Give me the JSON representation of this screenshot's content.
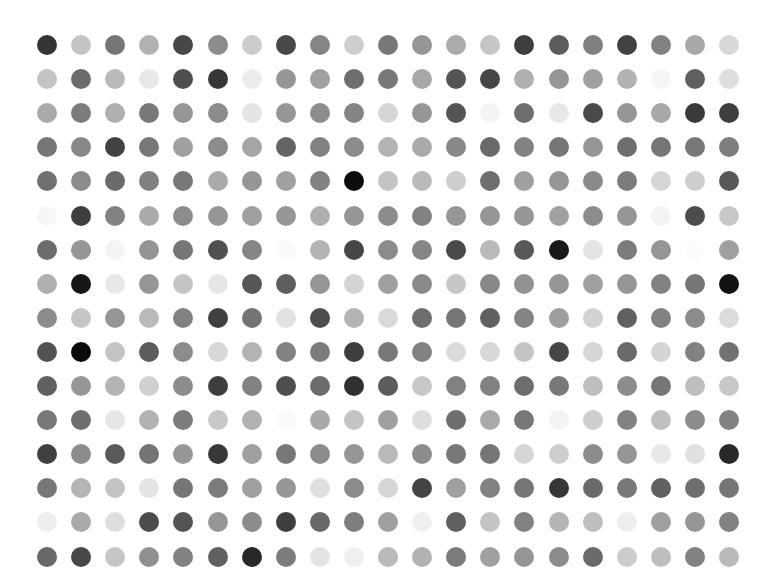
{
  "page": {
    "background_color": "#ffffff",
    "width": 772,
    "height": 586
  },
  "chart_data": {
    "type": "heatmap",
    "title": "",
    "subtitle": "",
    "xlabel": "",
    "ylabel": "",
    "legend": [],
    "annotations": [],
    "grid": false,
    "marker": "circle",
    "columns": 21,
    "rows": 16,
    "xlim": [
      0,
      20
    ],
    "ylim": [
      0,
      15
    ],
    "x_tick_labels": [],
    "y_tick_labels": [],
    "layout": {
      "origin_x": 47,
      "origin_y": 45,
      "pitch_x": 34.1,
      "pitch_y": 34.1,
      "dot_diameter": 20
    },
    "colormap": "grayscale",
    "value_range": [
      0,
      255
    ],
    "values": [
      [
        52,
        196,
        118,
        178,
        70,
        140,
        204,
        72,
        133,
        206,
        120,
        150,
        171,
        198,
        62,
        92,
        128,
        66,
        130,
        168,
        216,
        240,
        96
      ],
      [
        196,
        108,
        186,
        232,
        78,
        54,
        236,
        150,
        160,
        110,
        120,
        168,
        84,
        70,
        176,
        150,
        160,
        178,
        246,
        96,
        222,
        44,
        52
      ],
      [
        170,
        124,
        176,
        120,
        150,
        140,
        228,
        150,
        140,
        132,
        214,
        150,
        84,
        244,
        110,
        232,
        74,
        150,
        168,
        58,
        62,
        140,
        96
      ],
      [
        118,
        136,
        66,
        120,
        160,
        140,
        166,
        100,
        130,
        140,
        180,
        170,
        136,
        106,
        130,
        118,
        150,
        110,
        118,
        120,
        126,
        150,
        140
      ],
      [
        112,
        140,
        106,
        128,
        120,
        170,
        150,
        160,
        130,
        12,
        196,
        186,
        206,
        110,
        160,
        150,
        138,
        124,
        214,
        206,
        88,
        186,
        140
      ],
      [
        246,
        62,
        130,
        170,
        140,
        150,
        160,
        150,
        176,
        150,
        140,
        130,
        150,
        150,
        150,
        160,
        140,
        150,
        244,
        76,
        200,
        96
      ],
      [
        108,
        150,
        244,
        148,
        118,
        80,
        134,
        250,
        180,
        70,
        140,
        134,
        74,
        186,
        88,
        24,
        228,
        124,
        150,
        252,
        160,
        150,
        170
      ],
      [
        176,
        22,
        232,
        150,
        196,
        230,
        86,
        94,
        150,
        212,
        160,
        138,
        198,
        136,
        146,
        150,
        160,
        150,
        130,
        118,
        18,
        224
      ],
      [
        140,
        198,
        150,
        186,
        130,
        64,
        116,
        226,
        78,
        180,
        218,
        110,
        118,
        96,
        132,
        158,
        210,
        96,
        130,
        140,
        220,
        160,
        150
      ],
      [
        82,
        10,
        196,
        92,
        140,
        216,
        180,
        130,
        124,
        62,
        120,
        130,
        220,
        216,
        196,
        70,
        214,
        106,
        212,
        130,
        114,
        44,
        130
      ],
      [
        96,
        150,
        180,
        208,
        140,
        62,
        130,
        78,
        108,
        48,
        92,
        200,
        130,
        130,
        110,
        120,
        190,
        140,
        118,
        190,
        200,
        216,
        150
      ],
      [
        120,
        110,
        230,
        178,
        124,
        200,
        178,
        250,
        168,
        196,
        160,
        222,
        110,
        170,
        120,
        244,
        206,
        130,
        192,
        140,
        130,
        50,
        110
      ],
      [
        64,
        140,
        90,
        116,
        150,
        56,
        160,
        120,
        140,
        150,
        186,
        140,
        120,
        118,
        214,
        206,
        140,
        150,
        232,
        224,
        40,
        230,
        118
      ],
      [
        120,
        180,
        196,
        228,
        118,
        124,
        160,
        150,
        222,
        140,
        214,
        68,
        160,
        130,
        118,
        54,
        106,
        120,
        96,
        110,
        118,
        124,
        200
      ],
      [
        238,
        170,
        222,
        76,
        84,
        150,
        140,
        62,
        104,
        126,
        160,
        240,
        96,
        196,
        130,
        180,
        190,
        238,
        160,
        150,
        130,
        96,
        70
      ],
      [
        104,
        72,
        198,
        144,
        130,
        96,
        40,
        124,
        228,
        240,
        186,
        178,
        124,
        160,
        150,
        140,
        106,
        204,
        190,
        130,
        186,
        120,
        96
      ]
    ]
  }
}
